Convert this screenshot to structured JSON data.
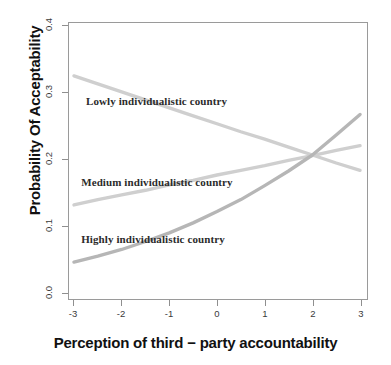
{
  "chart_data": {
    "type": "line",
    "title": "",
    "xlabel": "Perception of third − party accountability",
    "ylabel": "Probability Of Acceptability",
    "xlim": [
      -3,
      3
    ],
    "ylim": [
      0.0,
      0.4
    ],
    "xticks": [
      "-3",
      "-2",
      "-1",
      "0",
      "1",
      "2",
      "3"
    ],
    "xtick_values": [
      -3,
      -2,
      -1,
      0,
      1,
      2,
      3
    ],
    "yticks": [
      "0.0",
      "0.1",
      "0.2",
      "0.3",
      "0.4"
    ],
    "ytick_values": [
      0.0,
      0.1,
      0.2,
      0.3,
      0.4
    ],
    "grid": false,
    "legend": "in-plot annotations",
    "x": [
      -3,
      -2.5,
      -2,
      -1.5,
      -1,
      -0.5,
      0,
      0.5,
      1,
      1.5,
      2,
      2.5,
      3
    ],
    "series": [
      {
        "name": "Lowly individualistic country",
        "color": "#cfcfcf",
        "values": [
          0.325,
          0.313,
          0.301,
          0.289,
          0.277,
          0.265,
          0.253,
          0.241,
          0.23,
          0.218,
          0.206,
          0.194,
          0.183
        ]
      },
      {
        "name": "Medium individualistic country",
        "color": "#cfcfcf",
        "values": [
          0.131,
          0.139,
          0.146,
          0.153,
          0.161,
          0.168,
          0.176,
          0.183,
          0.19,
          0.198,
          0.205,
          0.213,
          0.22
        ]
      },
      {
        "name": "Highly individualistic country",
        "color": "#b6b6b6",
        "values": [
          0.045,
          0.054,
          0.064,
          0.076,
          0.089,
          0.104,
          0.121,
          0.139,
          0.16,
          0.182,
          0.206,
          0.236,
          0.267
        ]
      }
    ],
    "annotations": [
      {
        "text": "Lowly individualistic country",
        "x": -2.75,
        "y": 0.286
      },
      {
        "text": "Medium individualistic country",
        "x": -2.85,
        "y": 0.166
      },
      {
        "text": "Highly individualistic country",
        "x": -2.85,
        "y": 0.081
      }
    ],
    "colors": {
      "line_light": "#cfcfcf",
      "line_mid": "#b6b6b6",
      "axis": "#8f8f8f",
      "text": "#111111",
      "background": "#ffffff"
    }
  }
}
